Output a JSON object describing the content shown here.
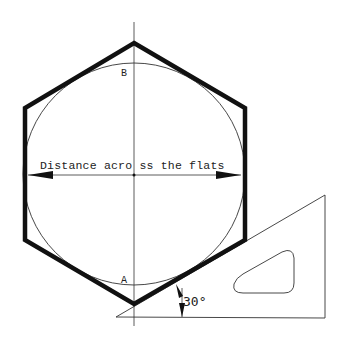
{
  "diagram": {
    "labels": {
      "dimension": "Distance acro ss the flats",
      "point_top": "B",
      "point_bottom": "A",
      "angle": "30°"
    },
    "colors": {
      "ink": "#1a1a1a",
      "background": "#ffffff"
    },
    "shapes": {
      "hexagon": "regular hexagon, vertex up, heavy outline",
      "circle": "inscribed circle touching flats",
      "triangle": "30-60 set square with rounded cutout"
    }
  }
}
